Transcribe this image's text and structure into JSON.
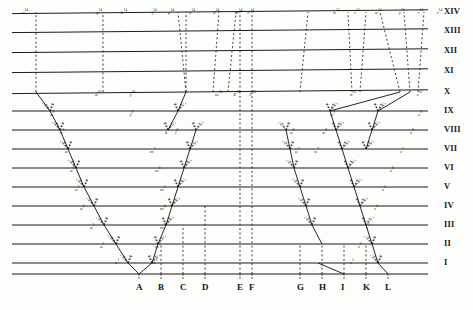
{
  "figure": {
    "ink_color": "#1a1a1a",
    "paper_color": "#fdfdfb"
  },
  "chart_data": {
    "type": "diagram",
    "xlabel": "",
    "ylabel": "",
    "grid": true,
    "legend": "none",
    "generation_lines": [
      {
        "label": "I",
        "y": 263
      },
      {
        "label": "II",
        "y": 244
      },
      {
        "label": "III",
        "y": 225
      },
      {
        "label": "IV",
        "y": 206
      },
      {
        "label": "V",
        "y": 187
      },
      {
        "label": "VI",
        "y": 168
      },
      {
        "label": "VII",
        "y": 149
      },
      {
        "label": "VIII",
        "y": 130
      },
      {
        "label": "IX",
        "y": 111
      },
      {
        "label": "X",
        "y": 92
      },
      {
        "label": "XI",
        "y": 71
      },
      {
        "label": "XII",
        "y": 51
      },
      {
        "label": "XIII",
        "y": 31
      },
      {
        "label": "XIV",
        "y": 12
      }
    ],
    "species": [
      {
        "label": "A",
        "x": 139
      },
      {
        "label": "B",
        "x": 161
      },
      {
        "label": "C",
        "x": 183
      },
      {
        "label": "D",
        "x": 205
      },
      {
        "label": "E",
        "x": 240
      },
      {
        "label": "F",
        "x": 252
      },
      {
        "label": "G",
        "x": 300
      },
      {
        "label": "H",
        "x": 322
      },
      {
        "label": "I",
        "x": 344
      },
      {
        "label": "K",
        "x": 366
      },
      {
        "label": "L",
        "x": 388
      }
    ],
    "taxon_labels": [
      {
        "text": "a",
        "sup": "14",
        "x": 22,
        "y": 8
      },
      {
        "text": "q",
        "sup": "14",
        "x": 96,
        "y": 8
      },
      {
        "text": "p",
        "sup": "14",
        "x": 168,
        "y": 8
      },
      {
        "text": "b",
        "sup": "14",
        "x": 363,
        "y": 8
      },
      {
        "text": "f",
        "sup": "14",
        "x": 455,
        "y": 8
      },
      {
        "text": "o",
        "sup": "14",
        "x": 567,
        "y": 8
      },
      {
        "text": "e",
        "sup": "14",
        "x": 640,
        "y": 8
      },
      {
        "text": "m",
        "sup": "14",
        "x": 705,
        "y": 8
      },
      {
        "text": "F",
        "sup": "14",
        "x": 742,
        "y": 8
      },
      {
        "text": "n",
        "sup": "14",
        "x": 1000,
        "y": 8
      },
      {
        "text": "r",
        "sup": "14",
        "x": 1062,
        "y": 8
      },
      {
        "text": "w",
        "sup": "14",
        "x": 1124,
        "y": 8
      },
      {
        "text": "y",
        "sup": "14",
        "x": 1196,
        "y": 8
      },
      {
        "text": "v",
        "sup": "14",
        "x": 1252,
        "y": 8
      },
      {
        "text": "z",
        "sup": "14",
        "x": 1310,
        "y": 8
      },
      {
        "text": "a",
        "sup": "10",
        "x": 95,
        "y": 90
      },
      {
        "text": "f",
        "sup": "10",
        "x": 390,
        "y": 90
      },
      {
        "text": "m",
        "sup": "10",
        "x": 645,
        "y": 90
      },
      {
        "text": "E",
        "sup": "10",
        "x": 700,
        "y": 90
      },
      {
        "text": "F",
        "sup": "10",
        "x": 748,
        "y": 90
      },
      {
        "text": "n",
        "sup": "10",
        "x": 1050,
        "y": 90
      },
      {
        "text": "z",
        "sup": "10",
        "x": 1250,
        "y": 90
      },
      {
        "text": "a",
        "sup": "9",
        "y": 110,
        "x": 50
      },
      {
        "text": "f",
        "sup": "9",
        "y": 110,
        "x": 130
      },
      {
        "text": "a",
        "sup": "8",
        "y": 128,
        "x": 60
      },
      {
        "text": "k",
        "sup": "8",
        "y": 128,
        "x": 165
      },
      {
        "text": "l",
        "sup": "8",
        "y": 128,
        "x": 175
      },
      {
        "text": "a",
        "sup": "7",
        "y": 147,
        "x": 65
      },
      {
        "text": "m",
        "sup": "7",
        "y": 147,
        "x": 150
      },
      {
        "text": "a",
        "sup": "6",
        "y": 166,
        "x": 70
      },
      {
        "text": "m",
        "sup": "6",
        "y": 166,
        "x": 155
      },
      {
        "text": "a",
        "sup": "5",
        "y": 185,
        "x": 75
      },
      {
        "text": "m",
        "sup": "5",
        "y": 185,
        "x": 160
      },
      {
        "text": "a",
        "sup": "4",
        "y": 204,
        "x": 80
      },
      {
        "text": "m",
        "sup": "4",
        "y": 204,
        "x": 160
      },
      {
        "text": "a",
        "sup": "3",
        "y": 223,
        "x": 90
      },
      {
        "text": "m",
        "sup": "3",
        "y": 223,
        "x": 160
      },
      {
        "text": "a",
        "sup": "2",
        "y": 242,
        "x": 100
      },
      {
        "text": "m",
        "sup": "2",
        "y": 242,
        "x": 155
      },
      {
        "text": "a",
        "sup": "1",
        "y": 258,
        "x": 115
      },
      {
        "text": "m",
        "sup": "1",
        "y": 258,
        "x": 152
      },
      {
        "text": "z",
        "sup": "9",
        "y": 110,
        "x": 418
      },
      {
        "text": "z",
        "sup": "8",
        "y": 128,
        "x": 410
      },
      {
        "text": "z",
        "sup": "7",
        "y": 147,
        "x": 400
      },
      {
        "text": "z",
        "sup": "6",
        "y": 166,
        "x": 390
      },
      {
        "text": "z",
        "sup": "5",
        "y": 185,
        "x": 382
      },
      {
        "text": "z",
        "sup": "4",
        "y": 204,
        "x": 374
      },
      {
        "text": "z",
        "sup": "3",
        "y": 223,
        "x": 366
      },
      {
        "text": "z",
        "sup": "2",
        "y": 242,
        "x": 358
      },
      {
        "text": "z",
        "sup": "1",
        "y": 258,
        "x": 350
      },
      {
        "text": "w",
        "sup": "9",
        "y": 110,
        "x": 330
      },
      {
        "text": "w",
        "sup": "8",
        "y": 128,
        "x": 322
      },
      {
        "text": "w",
        "sup": "7",
        "y": 147,
        "x": 314
      },
      {
        "text": "u",
        "sup": "8",
        "y": 128,
        "x": 290
      },
      {
        "text": "u",
        "sup": "7",
        "y": 147,
        "x": 295
      }
    ]
  }
}
